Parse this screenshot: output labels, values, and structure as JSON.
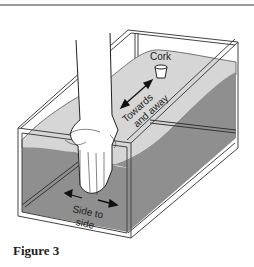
{
  "figure": {
    "caption": "Figure 3",
    "labels": {
      "cork": "Cork",
      "towards_line1": "Towards",
      "towards_line2": "and away",
      "side_line1": "Side to",
      "side_line2": "side"
    },
    "colors": {
      "water_surface": "#d6d6d6",
      "water_body": "#8f8f8f",
      "water_side": "#a3a3a3",
      "frame": "#ffffff",
      "outline": "#444444"
    }
  }
}
